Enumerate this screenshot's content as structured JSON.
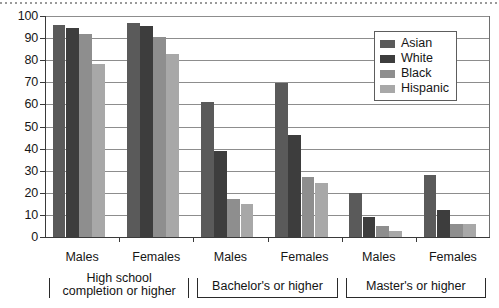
{
  "chart_data": {
    "type": "bar",
    "title": "",
    "subtitle": "",
    "xlabel": "",
    "ylabel": "",
    "ylim": [
      0,
      100
    ],
    "yticks": [
      0,
      10,
      20,
      30,
      40,
      50,
      60,
      70,
      80,
      90,
      100
    ],
    "grid": true,
    "legend_position": "top-right",
    "categories": [
      "Males",
      "Females",
      "Males",
      "Females",
      "Males",
      "Females"
    ],
    "category_groups": [
      {
        "label": "High school completion or higher",
        "categories": [
          "Males",
          "Females"
        ]
      },
      {
        "label": "Bachelor's or higher",
        "categories": [
          "Males",
          "Females"
        ]
      },
      {
        "label": "Master's or higher",
        "categories": [
          "Males",
          "Females"
        ]
      }
    ],
    "series": [
      {
        "name": "Asian",
        "color": "#5a5a5a",
        "values": [
          96,
          97,
          61,
          69.5,
          20,
          28
        ]
      },
      {
        "name": "White",
        "color": "#3d3d3d",
        "values": [
          94.5,
          95.5,
          39,
          46,
          9,
          12
        ]
      },
      {
        "name": "Black",
        "color": "#8e8e8e",
        "values": [
          92,
          90.5,
          17,
          27,
          5,
          6
        ]
      },
      {
        "name": "Hispanic",
        "color": "#a8a8a8",
        "values": [
          78.5,
          83,
          15,
          24.5,
          2.5,
          6
        ]
      }
    ]
  },
  "legend": {
    "items": [
      {
        "label": "Asian"
      },
      {
        "label": "White"
      },
      {
        "label": "Black"
      },
      {
        "label": "Hispanic"
      }
    ]
  },
  "axis": {
    "y_tick_labels": [
      "100",
      "90",
      "80",
      "70",
      "60",
      "50",
      "40",
      "30",
      "20",
      "10",
      "0"
    ],
    "x_tick_labels": [
      "Males",
      "Females",
      "Males",
      "Females",
      "Males",
      "Females"
    ]
  },
  "brackets": [
    {
      "line1": "High school",
      "line2": "completion or higher",
      "text": "High school completion or higher"
    },
    {
      "line1": "Bachelor's or higher",
      "line2": "",
      "text": "Bachelor's or higher"
    },
    {
      "line1": "Master's or higher",
      "line2": "",
      "text": "Master's or higher"
    }
  ]
}
